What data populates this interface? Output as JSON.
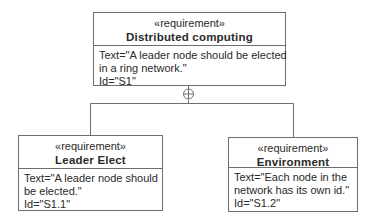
{
  "diagram": {
    "type": "SysML requirement diagram",
    "relationship": "containment",
    "colors": {
      "line": "#6e6e6e",
      "box_fill": "#ffffff",
      "text": "#2a2a2a"
    },
    "requirements": [
      {
        "stereotype": "«requirement»",
        "name": "Distributed computing",
        "text_lines": [
          "Text=\"A leader node should be elected",
          "in a ring network.\""
        ],
        "id_line": "Id=\"S1\""
      },
      {
        "stereotype": "«requirement»",
        "name": "Leader Elect",
        "text_lines": [
          "Text=\"A leader node should",
          "be elected.\""
        ],
        "id_line": "Id=\"S1.1\""
      },
      {
        "stereotype": "«requirement»",
        "name": "Environment",
        "text_lines": [
          "Text=\"Each node in the",
          "network has its own id.\""
        ],
        "id_line": "Id=\"S1.2\""
      }
    ],
    "icons": {
      "containment": "circle-plus-icon"
    }
  }
}
